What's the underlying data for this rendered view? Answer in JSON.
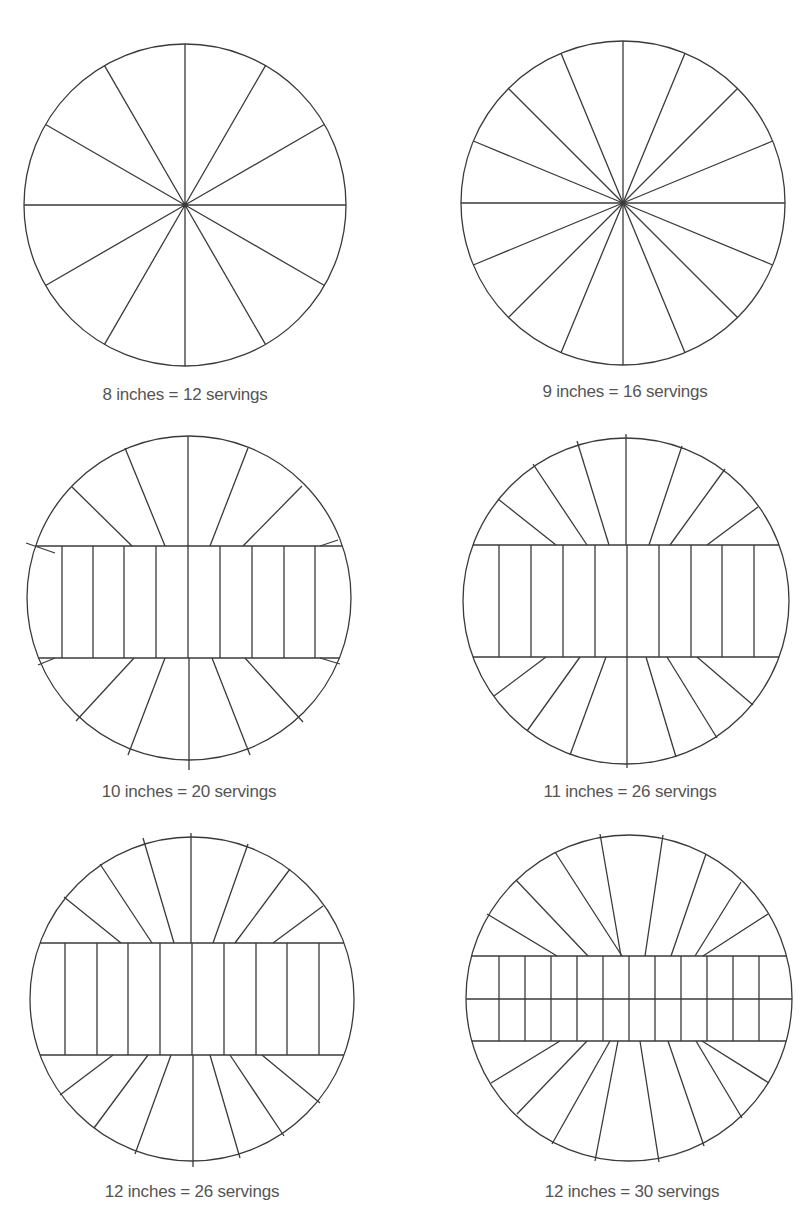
{
  "colors": {
    "line": "#3a3a3a",
    "caption": "#555555",
    "background": "#ffffff"
  },
  "diagrams": [
    {
      "caption": "8 inches = 12 servings",
      "size_inches": 8,
      "servings": 12,
      "pattern": "radial",
      "cx": 185,
      "cy": 205,
      "r": 161,
      "wedges": 12,
      "caption_x": 185,
      "caption_y": 385
    },
    {
      "caption": "9 inches = 16 servings",
      "size_inches": 9,
      "servings": 16,
      "pattern": "radial",
      "cx": 623,
      "cy": 203,
      "r": 162,
      "wedges": 16,
      "caption_x": 625,
      "caption_y": 382
    },
    {
      "caption": "10 inches = 20 servings",
      "size_inches": 10,
      "servings": 20,
      "pattern": "band",
      "cx": 189,
      "cy": 598,
      "r": 162,
      "band_top": 546,
      "band_bottom": 658,
      "band_cols": [
        22,
        62,
        93,
        124,
        156,
        188,
        220,
        252,
        284,
        315,
        355
      ],
      "top_wedges": [
        [
          26,
          543,
          55,
          553
        ],
        [
          72,
          487,
          132,
          546
        ],
        [
          125,
          448,
          165,
          546
        ],
        [
          188,
          436,
          188,
          546
        ],
        [
          248,
          448,
          210,
          546
        ],
        [
          302,
          486,
          243,
          546
        ],
        [
          338,
          540,
          320,
          546
        ]
      ],
      "bottom_wedges": [
        [
          38,
          665,
          55,
          658
        ],
        [
          76,
          721,
          134,
          658
        ],
        [
          128,
          755,
          165,
          658
        ],
        [
          189,
          770,
          189,
          658
        ],
        [
          250,
          755,
          212,
          658
        ],
        [
          303,
          722,
          245,
          658
        ],
        [
          340,
          664,
          320,
          658
        ]
      ],
      "caption_x": 189,
      "caption_y": 782
    },
    {
      "caption": "11 inches = 26 servings",
      "size_inches": 11,
      "servings": 26,
      "pattern": "band",
      "cx": 626,
      "cy": 601,
      "r": 163,
      "band_top": 545,
      "band_bottom": 657,
      "band_cols": [
        463,
        499,
        531,
        563,
        595,
        627,
        659,
        691,
        722,
        754,
        790
      ],
      "top_wedges": [
        [
          498,
          499,
          556,
          545
        ],
        [
          533,
          464,
          587,
          545
        ],
        [
          577,
          441,
          609,
          545
        ],
        [
          626,
          434,
          626,
          545
        ],
        [
          682,
          446,
          649,
          545
        ],
        [
          725,
          469,
          670,
          545
        ],
        [
          758,
          507,
          707,
          545
        ]
      ],
      "bottom_wedges": [
        [
          494,
          696,
          546,
          657
        ],
        [
          527,
          731,
          580,
          657
        ],
        [
          570,
          755,
          606,
          657
        ],
        [
          627,
          768,
          627,
          657
        ],
        [
          676,
          757,
          646,
          657
        ],
        [
          717,
          738,
          667,
          657
        ],
        [
          753,
          705,
          697,
          657
        ]
      ],
      "caption_x": 630,
      "caption_y": 782
    },
    {
      "caption": "12 inches = 26 servings",
      "size_inches": 12,
      "servings": 26,
      "pattern": "band",
      "cx": 192,
      "cy": 999,
      "r": 162,
      "band_top": 943,
      "band_bottom": 1055,
      "band_cols": [
        38,
        65,
        97,
        128,
        160,
        192,
        224,
        256,
        287,
        319,
        345
      ],
      "top_wedges": [
        [
          64,
          897,
          121,
          943
        ],
        [
          100,
          864,
          152,
          943
        ],
        [
          143,
          838,
          174,
          943
        ],
        [
          191,
          833,
          191,
          943
        ],
        [
          248,
          844,
          213,
          943
        ],
        [
          290,
          869,
          235,
          943
        ],
        [
          323,
          906,
          273,
          943
        ]
      ],
      "bottom_wedges": [
        [
          60,
          1095,
          113,
          1055
        ],
        [
          94,
          1128,
          148,
          1055
        ],
        [
          135,
          1154,
          171,
          1055
        ],
        [
          193,
          1167,
          193,
          1055
        ],
        [
          240,
          1158,
          210,
          1055
        ],
        [
          284,
          1136,
          230,
          1055
        ],
        [
          320,
          1103,
          262,
          1055
        ]
      ],
      "caption_x": 192,
      "caption_y": 1182
    },
    {
      "caption": "12 inches = 30 servings",
      "size_inches": 12,
      "servings": 30,
      "pattern": "double-band",
      "cx": 629,
      "cy": 998,
      "r": 163,
      "band_top": 956,
      "band_mid": 999,
      "band_bottom": 1041,
      "band_cols": [
        466,
        499,
        525,
        551,
        577,
        603,
        629,
        655,
        681,
        707,
        733,
        759,
        786
      ],
      "top_wedges": [
        [
          487,
          914,
          557,
          956
        ],
        [
          516,
          880,
          588,
          956
        ],
        [
          555,
          852,
          622,
          956
        ],
        [
          600,
          834,
          621,
          956
        ],
        [
          663,
          835,
          645,
          956
        ],
        [
          706,
          854,
          671,
          956
        ],
        [
          741,
          882,
          695,
          956
        ],
        [
          768,
          914,
          703,
          956
        ]
      ],
      "bottom_wedges": [
        [
          491,
          1083,
          560,
          1041
        ],
        [
          517,
          1114,
          587,
          1041
        ],
        [
          552,
          1144,
          610,
          1041
        ],
        [
          595,
          1161,
          618,
          1041
        ],
        [
          659,
          1162,
          640,
          1041
        ],
        [
          704,
          1146,
          668,
          1041
        ],
        [
          742,
          1118,
          696,
          1041
        ],
        [
          769,
          1083,
          702,
          1041
        ]
      ],
      "caption_x": 632,
      "caption_y": 1182
    }
  ]
}
